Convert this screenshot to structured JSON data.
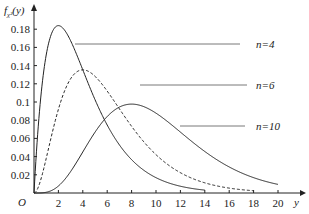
{
  "chart_data": {
    "type": "line",
    "title": "",
    "xlabel": "y",
    "ylabel": "f_χ²(y)",
    "origin_label": "O",
    "xlim": [
      0,
      21
    ],
    "ylim": [
      0,
      0.19
    ],
    "grid": false,
    "x_ticks": [
      2,
      4,
      6,
      8,
      10,
      12,
      14,
      16,
      18,
      20
    ],
    "y_ticks": [
      0.02,
      0.04,
      0.06,
      0.08,
      0.1,
      0.12,
      0.14,
      0.16,
      0.18
    ],
    "y_tick_labels": [
      "0.02",
      "0.04",
      "0.06",
      "0.08",
      "0.1",
      "0.12",
      "0.14",
      "0.16",
      "0.18"
    ],
    "series": [
      {
        "name": "n=4",
        "df": 4,
        "style": "solid",
        "x_range": [
          0,
          14
        ],
        "peak": {
          "x": 2,
          "y": 0.184
        }
      },
      {
        "name": "n=6",
        "df": 6,
        "style": "dashed",
        "x_range": [
          0,
          18
        ],
        "peak": {
          "x": 4,
          "y": 0.135
        }
      },
      {
        "name": "n=10",
        "df": 10,
        "style": "solid",
        "x_range": [
          0,
          20
        ],
        "peak": {
          "x": 8,
          "y": 0.098
        }
      }
    ],
    "annotations": [
      {
        "text": "n=4",
        "label_x": 256,
        "label_y": 48,
        "leader_from": [
          75,
          44
        ],
        "leader_to": [
          240,
          44
        ]
      },
      {
        "text": "n=6",
        "label_x": 256,
        "label_y": 89,
        "leader_from": [
          140,
          85
        ],
        "leader_to": [
          247,
          85
        ]
      },
      {
        "text": "n=10",
        "label_x": 256,
        "label_y": 130,
        "leader_from": [
          180,
          126
        ],
        "leader_to": [
          245,
          126
        ]
      }
    ],
    "legend_position": "inline-annotations"
  }
}
